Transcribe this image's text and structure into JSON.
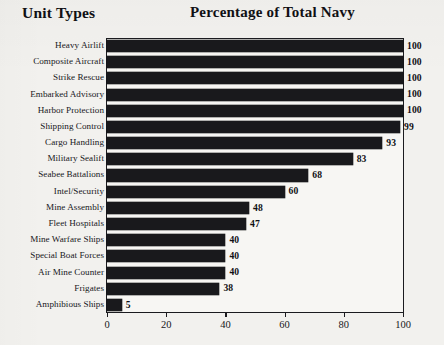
{
  "header": {
    "left_header": "Unit Types",
    "title": "Percentage of Total Navy"
  },
  "chart_data": {
    "type": "bar",
    "orientation": "horizontal",
    "title": "Percentage of Total Navy",
    "xlabel": "",
    "ylabel": "Unit Types",
    "xlim": [
      0,
      100
    ],
    "xticks": [
      0,
      20,
      40,
      60,
      80,
      100
    ],
    "grid": false,
    "legend": "none",
    "bar_color": "#19191c",
    "categories": [
      "Heavy Airlift",
      "Composite Aircraft",
      "Strike Rescue",
      "Embarked Advisory",
      "Harbor Protection",
      "Shipping Control",
      "Cargo Handling",
      "Military Sealift",
      "Seabee Battalions",
      "Intel/Security",
      "Mine Assembly",
      "Fleet Hospitals",
      "Mine Warfare Ships",
      "Special Boat Forces",
      "Air Mine Counter",
      "Frigates",
      "Amphibious Ships"
    ],
    "values": [
      100,
      100,
      100,
      100,
      100,
      99,
      93,
      83,
      68,
      60,
      48,
      47,
      40,
      40,
      40,
      38,
      5
    ],
    "value_labels": [
      "100",
      "100",
      "100",
      "100",
      "100",
      "99",
      "93",
      "83",
      "68",
      "60",
      "48",
      "47",
      "40",
      "40",
      "40",
      "38",
      "5"
    ]
  }
}
